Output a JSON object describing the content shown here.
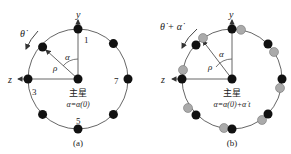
{
  "panels": [
    {
      "id": "a",
      "caption": "(a)",
      "axis_y": "y",
      "axis_z": "z",
      "rate_label": "θ̇",
      "angle_label": "α",
      "radius_label": "ρ",
      "center_label": "主星",
      "equation": "α=α(0)",
      "node_labels": {
        "top": "1",
        "left": "3",
        "bottom": "5",
        "right": "7"
      }
    },
    {
      "id": "b",
      "caption": "(b)",
      "axis_y": "y",
      "axis_z": "z",
      "rate_label": "θ̇ + α̇",
      "angle_label": "α",
      "radius_label": "ρ",
      "center_label": "主星",
      "equation": "α=α(0)+α̇ t"
    }
  ],
  "colors": {
    "line": "#444444",
    "node": "#111111",
    "ghost_node": "#aaaaaa"
  }
}
